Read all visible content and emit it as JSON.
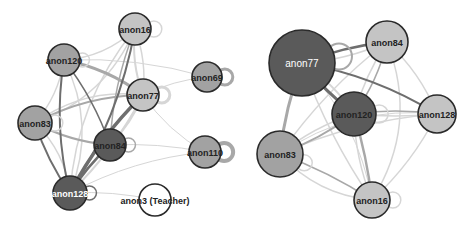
{
  "colors": {
    "node_light": "#c4c4c4",
    "node_mid": "#a2a2a2",
    "node_dark": "#5a5a5a",
    "node_white": "#ffffff",
    "node_stroke": "#2a2a2a",
    "edge_light": "#d6d6d6",
    "edge_mid": "#a8a8a8",
    "edge_dark": "#6e6e6e"
  },
  "graphs": [
    {
      "id": "left-network",
      "nodes": [
        {
          "id": "anon16",
          "label": "anon16",
          "x": 135,
          "y": 29,
          "r": 16,
          "shade": "node_light",
          "text": "dark"
        },
        {
          "id": "anon120",
          "label": "anon120",
          "x": 64,
          "y": 60,
          "r": 16,
          "shade": "node_mid",
          "text": "dark"
        },
        {
          "id": "anon77",
          "label": "anon77",
          "x": 143,
          "y": 95,
          "r": 16,
          "shade": "node_light",
          "text": "dark"
        },
        {
          "id": "anon69",
          "label": "anon69",
          "x": 207,
          "y": 77,
          "r": 15,
          "shade": "node_mid",
          "text": "dark"
        },
        {
          "id": "anon83",
          "label": "anon83",
          "x": 35,
          "y": 123,
          "r": 17,
          "shade": "node_mid",
          "text": "dark"
        },
        {
          "id": "anon84",
          "label": "anon84",
          "x": 110,
          "y": 145,
          "r": 16,
          "shade": "node_dark",
          "text": "dark"
        },
        {
          "id": "anon110",
          "label": "anon110",
          "x": 205,
          "y": 152,
          "r": 16,
          "shade": "node_mid",
          "text": "dark"
        },
        {
          "id": "anon128",
          "label": "anon128",
          "x": 70,
          "y": 193,
          "r": 17,
          "shade": "node_dark",
          "text": "light"
        },
        {
          "id": "anon3",
          "label": "anon3 (Teacher)",
          "x": 155,
          "y": 200,
          "r": 16,
          "shade": "node_white",
          "text": "dark"
        }
      ],
      "edges": [
        {
          "a": "anon16",
          "b": "anon120",
          "w": 1.5,
          "shade": "edge_light",
          "bend": -14
        },
        {
          "a": "anon16",
          "b": "anon77",
          "w": 2,
          "shade": "edge_light",
          "bend": 8
        },
        {
          "a": "anon16",
          "b": "anon77",
          "w": 1.5,
          "shade": "edge_light",
          "bend": -8
        },
        {
          "a": "anon16",
          "b": "anon83",
          "w": 1.5,
          "shade": "edge_light",
          "bend": -30
        },
        {
          "a": "anon16",
          "b": "anon84",
          "w": 1.5,
          "shade": "edge_mid",
          "bend": 10
        },
        {
          "a": "anon16",
          "b": "anon128",
          "w": 2,
          "shade": "edge_dark",
          "bend": -18
        },
        {
          "a": "anon16",
          "b": "anon128",
          "w": 1.5,
          "shade": "edge_light",
          "bend": 28
        },
        {
          "a": "anon120",
          "b": "anon77",
          "w": 3,
          "shade": "edge_mid",
          "bend": -10
        },
        {
          "a": "anon120",
          "b": "anon83",
          "w": 1.5,
          "shade": "edge_light",
          "bend": -10
        },
        {
          "a": "anon120",
          "b": "anon84",
          "w": 1.5,
          "shade": "edge_dark",
          "bend": -8
        },
        {
          "a": "anon120",
          "b": "anon128",
          "w": 2,
          "shade": "edge_dark",
          "bend": 14
        },
        {
          "a": "anon120",
          "b": "anon128",
          "w": 1.5,
          "shade": "edge_light",
          "bend": -30
        },
        {
          "a": "anon120",
          "b": "anon69",
          "w": 1,
          "shade": "edge_light",
          "bend": -12
        },
        {
          "a": "anon77",
          "b": "anon83",
          "w": 2,
          "shade": "edge_mid",
          "bend": 14
        },
        {
          "a": "anon77",
          "b": "anon84",
          "w": 2,
          "shade": "edge_light",
          "bend": -6
        },
        {
          "a": "anon77",
          "b": "anon128",
          "w": 3.5,
          "shade": "edge_dark",
          "bend": 10
        },
        {
          "a": "anon77",
          "b": "anon128",
          "w": 2,
          "shade": "edge_light",
          "bend": -10
        },
        {
          "a": "anon77",
          "b": "anon69",
          "w": 1,
          "shade": "edge_light",
          "bend": -6
        },
        {
          "a": "anon77",
          "b": "anon110",
          "w": 1,
          "shade": "edge_light",
          "bend": 10
        },
        {
          "a": "anon83",
          "b": "anon84",
          "w": 2,
          "shade": "edge_mid",
          "bend": 8
        },
        {
          "a": "anon83",
          "b": "anon128",
          "w": 2,
          "shade": "edge_dark",
          "bend": 6
        },
        {
          "a": "anon83",
          "b": "anon128",
          "w": 1.5,
          "shade": "edge_light",
          "bend": -14
        },
        {
          "a": "anon84",
          "b": "anon128",
          "w": 2.5,
          "shade": "edge_dark",
          "bend": 4
        },
        {
          "a": "anon84",
          "b": "anon110",
          "w": 1,
          "shade": "edge_light",
          "bend": -6
        },
        {
          "a": "anon128",
          "b": "anon110",
          "w": 1,
          "shade": "edge_light",
          "bend": -14
        },
        {
          "a": "anon128",
          "b": "anon3",
          "w": 1,
          "shade": "edge_light",
          "bend": -6
        },
        {
          "a": "anon83",
          "b": "anon77",
          "w": 1.5,
          "shade": "edge_light",
          "bend": -22
        }
      ],
      "self_loops": [
        {
          "node": "anon16",
          "w": 1.5,
          "shade": "edge_light",
          "r": 8,
          "angle": 0
        },
        {
          "node": "anon120",
          "w": 1.5,
          "shade": "edge_light",
          "r": 7,
          "angle": 0
        },
        {
          "node": "anon77",
          "w": 3,
          "shade": "edge_light",
          "r": 8,
          "angle": 0
        },
        {
          "node": "anon69",
          "w": 3,
          "shade": "edge_mid",
          "r": 8,
          "angle": 0
        },
        {
          "node": "anon83",
          "w": 1.5,
          "shade": "edge_light",
          "r": 8,
          "angle": 0
        },
        {
          "node": "anon84",
          "w": 1.5,
          "shade": "edge_mid",
          "r": 7,
          "angle": 0
        },
        {
          "node": "anon110",
          "w": 4,
          "shade": "edge_mid",
          "r": 9,
          "angle": 0
        },
        {
          "node": "anon128",
          "w": 1.5,
          "shade": "edge_dark",
          "r": 7,
          "angle": 0
        }
      ]
    },
    {
      "id": "right-network",
      "nodes": [
        {
          "id": "anon77",
          "label": "anon77",
          "x": 302,
          "y": 63,
          "r": 33,
          "shade": "node_dark",
          "text": "light",
          "big": true
        },
        {
          "id": "anon84",
          "label": "anon84",
          "x": 387,
          "y": 42,
          "r": 21,
          "shade": "node_light",
          "text": "dark"
        },
        {
          "id": "anon120",
          "label": "anon120",
          "x": 354,
          "y": 114,
          "r": 22,
          "shade": "node_dark",
          "text": "dark"
        },
        {
          "id": "anon128",
          "label": "anon128",
          "x": 437,
          "y": 114,
          "r": 19,
          "shade": "node_light",
          "text": "dark"
        },
        {
          "id": "anon83",
          "label": "anon83",
          "x": 280,
          "y": 154,
          "r": 23,
          "shade": "node_mid",
          "text": "dark"
        },
        {
          "id": "anon16",
          "label": "anon16",
          "x": 372,
          "y": 200,
          "r": 18,
          "shade": "node_light",
          "text": "dark"
        }
      ],
      "edges": [
        {
          "a": "anon77",
          "b": "anon84",
          "w": 2.5,
          "shade": "edge_dark",
          "bend": -6
        },
        {
          "a": "anon77",
          "b": "anon84",
          "w": 1.5,
          "shade": "edge_light",
          "bend": 8
        },
        {
          "a": "anon77",
          "b": "anon120",
          "w": 3,
          "shade": "edge_dark",
          "bend": 4
        },
        {
          "a": "anon77",
          "b": "anon120",
          "w": 2,
          "shade": "edge_light",
          "bend": -8
        },
        {
          "a": "anon77",
          "b": "anon128",
          "w": 2,
          "shade": "edge_dark",
          "bend": -14
        },
        {
          "a": "anon77",
          "b": "anon83",
          "w": 3,
          "shade": "edge_mid",
          "bend": 6
        },
        {
          "a": "anon77",
          "b": "anon16",
          "w": 1.5,
          "shade": "edge_light",
          "bend": 10
        },
        {
          "a": "anon84",
          "b": "anon120",
          "w": 1.5,
          "shade": "edge_light",
          "bend": 6
        },
        {
          "a": "anon84",
          "b": "anon120",
          "w": 1.5,
          "shade": "edge_mid",
          "bend": -8
        },
        {
          "a": "anon84",
          "b": "anon128",
          "w": 1.5,
          "shade": "edge_light",
          "bend": -10
        },
        {
          "a": "anon84",
          "b": "anon83",
          "w": 1.5,
          "shade": "edge_light",
          "bend": 12
        },
        {
          "a": "anon84",
          "b": "anon16",
          "w": 1.5,
          "shade": "edge_light",
          "bend": -40
        },
        {
          "a": "anon120",
          "b": "anon128",
          "w": 1.5,
          "shade": "edge_light",
          "bend": 4
        },
        {
          "a": "anon120",
          "b": "anon128",
          "w": 1.5,
          "shade": "edge_mid",
          "bend": -6
        },
        {
          "a": "anon120",
          "b": "anon83",
          "w": 2,
          "shade": "edge_mid",
          "bend": -6
        },
        {
          "a": "anon120",
          "b": "anon83",
          "w": 1.5,
          "shade": "edge_light",
          "bend": 8
        },
        {
          "a": "anon120",
          "b": "anon16",
          "w": 2.5,
          "shade": "edge_mid",
          "bend": -4
        },
        {
          "a": "anon120",
          "b": "anon16",
          "w": 1.5,
          "shade": "edge_light",
          "bend": 8
        },
        {
          "a": "anon128",
          "b": "anon83",
          "w": 1.5,
          "shade": "edge_light",
          "bend": 14
        },
        {
          "a": "anon128",
          "b": "anon16",
          "w": 1.5,
          "shade": "edge_light",
          "bend": -10
        },
        {
          "a": "anon83",
          "b": "anon16",
          "w": 1.5,
          "shade": "edge_mid",
          "bend": -6
        },
        {
          "a": "anon83",
          "b": "anon16",
          "w": 1.5,
          "shade": "edge_light",
          "bend": 20
        },
        {
          "a": "anon77",
          "b": "anon16",
          "w": 1,
          "shade": "edge_light",
          "bend": -24
        },
        {
          "a": "anon83",
          "b": "anon128",
          "w": 1,
          "shade": "edge_light",
          "bend": -30
        }
      ],
      "self_loops": [
        {
          "node": "anon77",
          "w": 2,
          "shade": "edge_mid",
          "r": 13,
          "angle": -10
        },
        {
          "node": "anon120",
          "w": 1.5,
          "shade": "edge_light",
          "r": 9,
          "angle": 0
        },
        {
          "node": "anon83",
          "w": 1.5,
          "shade": "edge_light",
          "r": 8,
          "angle": 20
        },
        {
          "node": "anon16",
          "w": 1.5,
          "shade": "edge_light",
          "r": 8,
          "angle": 0
        }
      ]
    }
  ]
}
